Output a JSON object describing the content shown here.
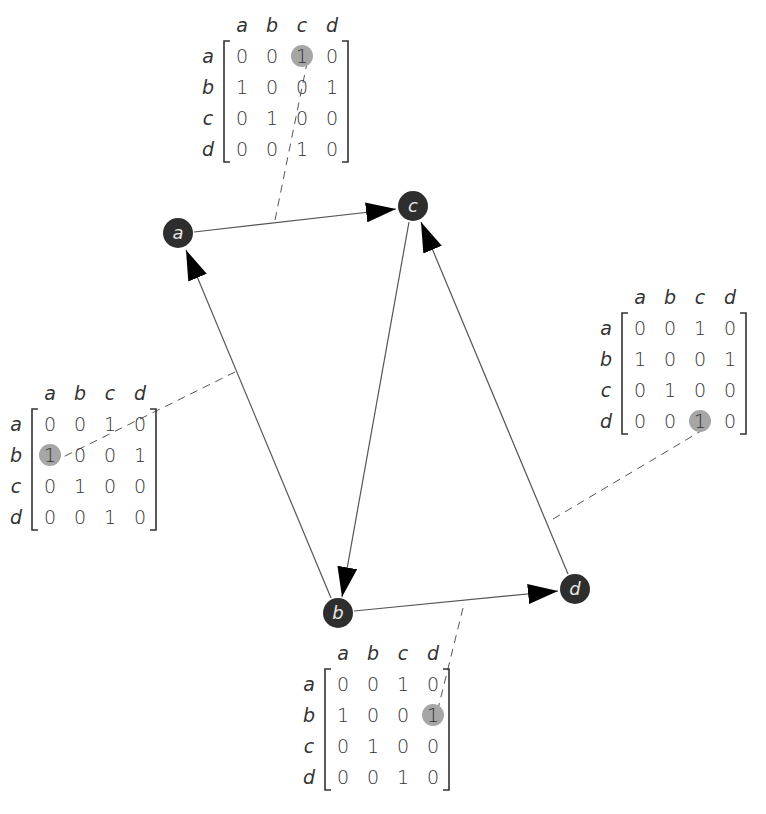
{
  "diagram": {
    "colors": {
      "node_fill": "#2e2e2e",
      "node_label": "#e6e6e6",
      "edge": "#555555",
      "highlight": "#a6a6a6",
      "text": "#333333"
    },
    "nodes": [
      {
        "id": "a",
        "label": "a",
        "x": 178,
        "y": 233
      },
      {
        "id": "b",
        "label": "b",
        "x": 338,
        "y": 613
      },
      {
        "id": "c",
        "label": "c",
        "x": 413,
        "y": 206
      },
      {
        "id": "d",
        "label": "d",
        "x": 575,
        "y": 589
      }
    ],
    "edges": [
      {
        "from": "a",
        "to": "c"
      },
      {
        "from": "b",
        "to": "a"
      },
      {
        "from": "c",
        "to": "b"
      },
      {
        "from": "b",
        "to": "d"
      },
      {
        "from": "d",
        "to": "c"
      }
    ],
    "matrix_headers": {
      "columns": [
        "a",
        "b",
        "c",
        "d"
      ],
      "rows": [
        "a",
        "b",
        "c",
        "d"
      ]
    },
    "matrix_values": [
      [
        "0",
        "0",
        "1",
        "0"
      ],
      [
        "1",
        "0",
        "0",
        "1"
      ],
      [
        "0",
        "1",
        "0",
        "0"
      ],
      [
        "0",
        "0",
        "1",
        "0"
      ]
    ],
    "matrices": [
      {
        "id": "top",
        "highlight_edge": "a→c",
        "highlight_row": 0,
        "highlight_col": 2,
        "origin_x": 242,
        "origin_y": 32
      },
      {
        "id": "left",
        "highlight_edge": "b→a",
        "highlight_row": 1,
        "highlight_col": 0,
        "origin_x": 50,
        "origin_y": 400
      },
      {
        "id": "right",
        "highlight_edge": "d→c",
        "highlight_row": 3,
        "highlight_col": 2,
        "origin_x": 640,
        "origin_y": 304
      },
      {
        "id": "bottom",
        "highlight_edge": "b→d",
        "highlight_row": 1,
        "highlight_col": 3,
        "origin_x": 343,
        "origin_y": 660
      }
    ]
  }
}
